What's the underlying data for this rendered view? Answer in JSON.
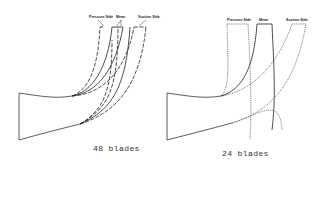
{
  "figure": {
    "panels": [
      {
        "id": "left",
        "caption": "48 blades",
        "labels": {
          "pressure": "Pressure Side",
          "mean": "Mean",
          "suction": "Suction Side"
        },
        "line_styles": {
          "pressure": "dashed",
          "mean": "solid",
          "suction": "dashed"
        }
      },
      {
        "id": "right",
        "caption": "24 blades",
        "labels": {
          "pressure": "Pressure Side",
          "mean": "Mean",
          "suction": "Suction Side"
        },
        "line_styles": {
          "pressure": "dotted",
          "mean": "solid",
          "suction": "dotted"
        }
      }
    ]
  }
}
